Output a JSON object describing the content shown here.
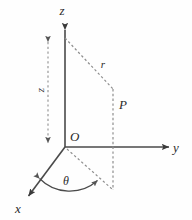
{
  "figure": {
    "background_color": "#fefefe",
    "line_color": "#4a4a4a",
    "dash_color": "#8e8e8e",
    "text_color": "#2b2b2b"
  },
  "axes": [
    {
      "id": "z",
      "label": "z",
      "description": "vertical axis pointing up",
      "label_x": 62,
      "label_y": 13,
      "direction": "up"
    },
    {
      "id": "y",
      "label": "y",
      "description": "horizontal axis pointing right",
      "label_x": 176,
      "label_y": 152,
      "direction": "right"
    },
    {
      "id": "x",
      "label": "x",
      "description": "oblique axis pointing down-left toward viewer",
      "label_x": 18,
      "label_y": 212,
      "direction": "down-left"
    }
  ],
  "origin": {
    "label": "O",
    "label_x": 70,
    "label_y": 140,
    "x": 65,
    "y": 147
  },
  "point": {
    "label": "P",
    "label_x": 120,
    "label_y": 108,
    "x": 113,
    "y": 101
  },
  "measurements": [
    {
      "id": "radius",
      "label": "r",
      "description": "dashed line from top of z segment to point P",
      "label_x": 103,
      "label_y": 66
    },
    {
      "id": "height",
      "label": "z",
      "description": "vertical dashed double arrow height of P above xy-plane",
      "label_x": 45,
      "label_y": 88,
      "rotated": true
    },
    {
      "id": "angle",
      "label": "θ",
      "description": "azimuthal angle between x-axis and projection of P",
      "label_x": 66,
      "label_y": 183
    }
  ],
  "geometry": {
    "z_axis": {
      "x1": 65,
      "y1": 27,
      "x2": 65,
      "y2": 147
    },
    "y_axis": {
      "x1": 65,
      "y1": 147,
      "x2": 172,
      "y2": 147
    },
    "x_axis": {
      "x1": 65,
      "y1": 147,
      "x2": 26,
      "y2": 199
    },
    "r_line": {
      "x1": 65,
      "y1": 38,
      "x2": 113,
      "y2": 89
    },
    "p_vertical": {
      "x1": 113,
      "y1": 89,
      "x2": 113,
      "y2": 190
    },
    "projection_line": {
      "x1": 65,
      "y1": 147,
      "x2": 113,
      "y2": 190
    },
    "height_marker": {
      "x": 48,
      "y1": 38,
      "y2": 147
    },
    "theta_arc": {
      "cx": 65,
      "cy": 147,
      "radius": 42
    }
  }
}
